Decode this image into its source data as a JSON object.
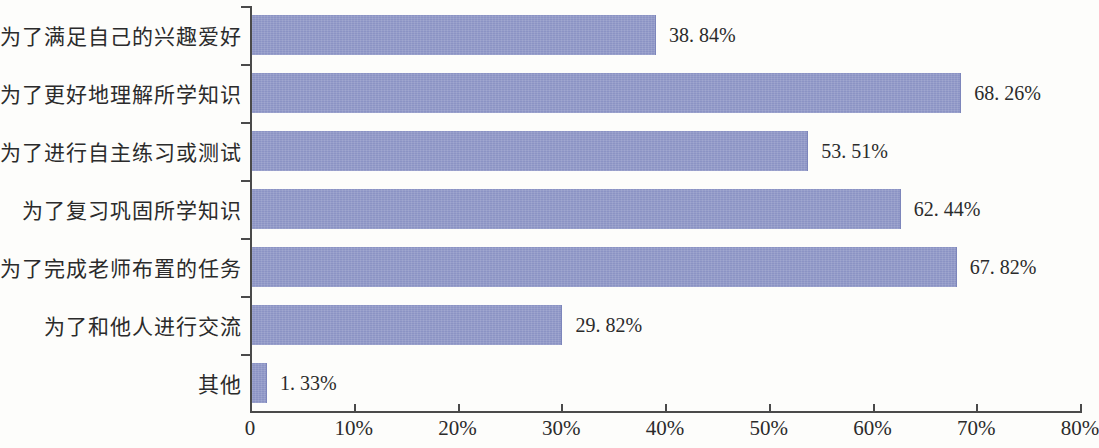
{
  "chart_data": {
    "type": "bar",
    "orientation": "horizontal",
    "title": "",
    "subtitle": "",
    "xlabel": "",
    "ylabel": "",
    "xlim": [
      0,
      80
    ],
    "grid": false,
    "legend": null,
    "bar_color": "#8b93c4",
    "categories": [
      "为了满足自己的兴趣爱好",
      "为了更好地理解所学知识",
      "为了进行自主练习或测试",
      "为了复习巩固所学知识",
      "为了完成老师布置的任务",
      "为了和他人进行交流",
      "其他"
    ],
    "values": [
      38.84,
      68.26,
      53.51,
      62.44,
      67.82,
      29.82,
      1.33
    ],
    "value_labels": [
      "38. 84%",
      "68. 26%",
      "53. 51%",
      "62. 44%",
      "67. 82%",
      "29. 82%",
      "1. 33%"
    ],
    "x_ticks": [
      0,
      10,
      20,
      30,
      40,
      50,
      60,
      70,
      80
    ],
    "x_tick_labels": [
      "0",
      "10%",
      "20%",
      "30%",
      "40%",
      "50%",
      "60%",
      "70%",
      "80%"
    ]
  }
}
